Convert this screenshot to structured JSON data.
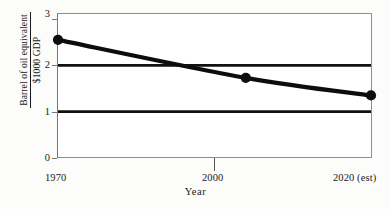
{
  "chart_data": {
    "type": "line",
    "title": "",
    "xlabel": "Year",
    "ylabel_numerator": "Barrel of oil equivalent",
    "ylabel_denominator": "$1000 GDP",
    "x_tick_labels": [
      "1970",
      "2000",
      "2020 (est)"
    ],
    "x_tick_values": [
      1970,
      2000,
      2020
    ],
    "y_tick_labels": [
      "0",
      "1",
      "2",
      "3"
    ],
    "y_tick_values": [
      0,
      1,
      2,
      3
    ],
    "ylim": [
      0,
      3
    ],
    "xlim": [
      1970,
      2020
    ],
    "grid": false,
    "legend": "none",
    "series": [
      {
        "name": "Barrel of oil equivalent per $1000 GDP",
        "x": [
          1970,
          2000,
          2020
        ],
        "values": [
          2.55,
          1.73,
          1.35
        ],
        "marker": "filled-circle",
        "color": "#0d0d0d",
        "line_width_px": 4.2
      }
    ],
    "reference_lines": [
      {
        "name": "upper-reference-line",
        "y": 2.0,
        "color": "#111111",
        "width_px": 2.6
      },
      {
        "name": "lower-reference-line",
        "y": 1.0,
        "color": "#111111",
        "width_px": 2.6
      }
    ],
    "annotations": []
  },
  "figure": {
    "background_color": "#fcfcfb",
    "plot_background_color": "#ffffff",
    "frame_color": "#8e8e8e"
  }
}
